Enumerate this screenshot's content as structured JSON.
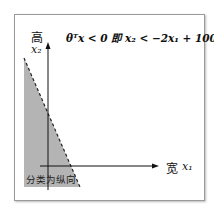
{
  "diagram": {
    "y_axis_label_cn": "高",
    "y_axis_var": "x₂",
    "x_axis_label_cn": "宽",
    "x_axis_var": "x₁",
    "equation": "θᵀx < 0 即 x₂ < −2x₁ + 100",
    "region_label": "分类为纵向",
    "region_color": "#b4b4b4",
    "boundary_style": "dashed"
  }
}
